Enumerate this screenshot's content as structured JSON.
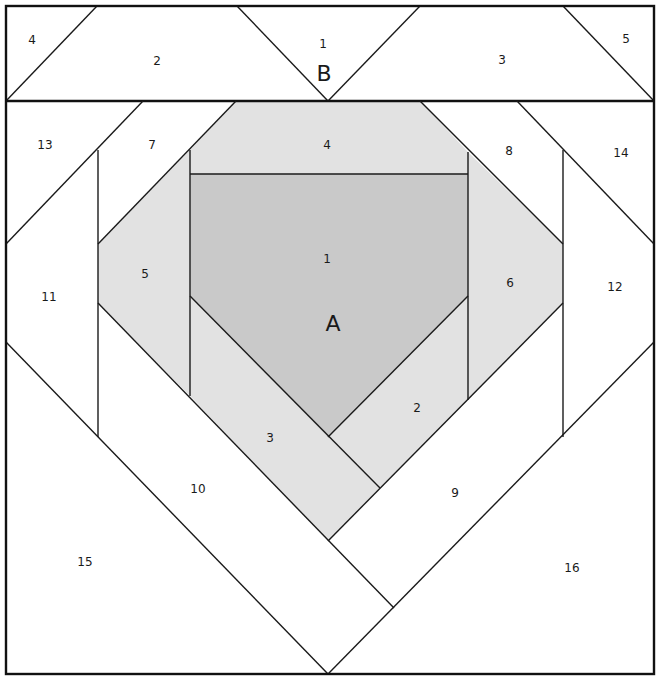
{
  "diagram": {
    "type": "foundation-paper-piecing-pattern",
    "colors": {
      "background": "#ffffff",
      "fill_dark": "#c9c9c9",
      "fill_light": "#e2e2e2",
      "line": "#1a1a1a"
    },
    "sections": [
      {
        "id": "B",
        "label": "B",
        "pieces": [
          {
            "num": "1",
            "label": "1"
          },
          {
            "num": "2",
            "label": "2"
          },
          {
            "num": "3",
            "label": "3"
          },
          {
            "num": "4",
            "label": "4"
          },
          {
            "num": "5",
            "label": "5"
          }
        ]
      },
      {
        "id": "A",
        "label": "A",
        "pieces": [
          {
            "num": "1",
            "label": "1",
            "shade": "dark"
          },
          {
            "num": "2",
            "label": "2",
            "shade": "light"
          },
          {
            "num": "3",
            "label": "3",
            "shade": "light"
          },
          {
            "num": "4",
            "label": "4",
            "shade": "light"
          },
          {
            "num": "5",
            "label": "5",
            "shade": "light"
          },
          {
            "num": "6",
            "label": "6",
            "shade": "light"
          },
          {
            "num": "7",
            "label": "7",
            "shade": "none"
          },
          {
            "num": "8",
            "label": "8",
            "shade": "none"
          },
          {
            "num": "9",
            "label": "9",
            "shade": "none"
          },
          {
            "num": "10",
            "label": "10",
            "shade": "none"
          },
          {
            "num": "11",
            "label": "11",
            "shade": "none"
          },
          {
            "num": "12",
            "label": "12",
            "shade": "none"
          },
          {
            "num": "13",
            "label": "13",
            "shade": "none"
          },
          {
            "num": "14",
            "label": "14",
            "shade": "none"
          },
          {
            "num": "15",
            "label": "15",
            "shade": "none"
          },
          {
            "num": "16",
            "label": "16",
            "shade": "none"
          }
        ]
      }
    ]
  }
}
